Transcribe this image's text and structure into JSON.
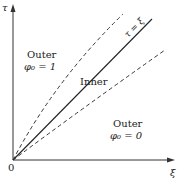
{
  "diagram": {
    "axes": {
      "vertical_label": "τ",
      "horizontal_label": "ξ",
      "origin_label": "0"
    },
    "lines": [
      {
        "id": "characteristic",
        "style": "solid",
        "label": "τ = ξ"
      },
      {
        "id": "upper-boundary",
        "style": "dashed"
      },
      {
        "id": "lower-boundary",
        "style": "dashed"
      }
    ],
    "regions": {
      "outer_upper": {
        "title": "Outer",
        "condition": "φ₀ = 1"
      },
      "inner": {
        "title": "Inner"
      },
      "outer_lower": {
        "title": "Outer",
        "condition": "φ₀ = 0"
      }
    },
    "colors": {
      "ink": "#222222",
      "background": "#ffffff"
    }
  }
}
